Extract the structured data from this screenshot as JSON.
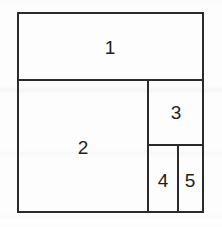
{
  "figure": {
    "name": "partitioned-rectangle-diagram",
    "background_color": "#fdfdfd",
    "line_color": "#2a2a2a",
    "line_width": 2,
    "label_color": "#1d1d1d",
    "outer_rect": {
      "x": 18,
      "y": 13,
      "width": 185,
      "height": 199
    },
    "regions": [
      {
        "id": "region-1",
        "label": "1",
        "x": 18,
        "y": 13,
        "width": 185,
        "height": 67,
        "label_x": 110,
        "label_y": 47
      },
      {
        "id": "region-2",
        "label": "2",
        "x": 18,
        "y": 80,
        "width": 130,
        "height": 132,
        "label_x": 83,
        "label_y": 147
      },
      {
        "id": "region-3",
        "label": "3",
        "x": 148,
        "y": 80,
        "width": 55,
        "height": 65,
        "label_x": 176,
        "label_y": 112
      },
      {
        "id": "region-4",
        "label": "4",
        "x": 148,
        "y": 145,
        "width": 30,
        "height": 67,
        "label_x": 163,
        "label_y": 180
      },
      {
        "id": "region-5",
        "label": "5",
        "x": 178,
        "y": 145,
        "width": 25,
        "height": 67,
        "label_x": 190,
        "label_y": 180
      }
    ],
    "dividers": [
      {
        "name": "divider-below-region-1",
        "orientation": "horizontal",
        "x1": 18,
        "y1": 80,
        "x2": 203,
        "y2": 80
      },
      {
        "name": "divider-left-of-region-3",
        "orientation": "vertical",
        "x1": 148,
        "y1": 80,
        "x2": 148,
        "y2": 212
      },
      {
        "name": "divider-below-region-3",
        "orientation": "horizontal",
        "x1": 148,
        "y1": 145,
        "x2": 203,
        "y2": 145
      },
      {
        "name": "divider-between-region-4-and-5",
        "orientation": "vertical",
        "x1": 178,
        "y1": 145,
        "x2": 178,
        "y2": 212
      }
    ]
  }
}
